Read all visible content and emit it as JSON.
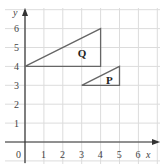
{
  "diagram": {
    "title": "",
    "axes": {
      "x_label": "x",
      "y_label": "y",
      "x_ticks": [
        "0",
        "1",
        "2",
        "3",
        "4",
        "5",
        "6"
      ],
      "y_ticks": [
        "1",
        "2",
        "3",
        "4",
        "5",
        "6"
      ],
      "origin_label": "0",
      "x_range": [
        0,
        6.5
      ],
      "y_range": [
        0,
        6.5
      ],
      "grid": true
    },
    "shapes": [
      {
        "name": "Q",
        "label": "Q",
        "type": "triangle",
        "vertices": [
          [
            0,
            4
          ],
          [
            4,
            6
          ],
          [
            4,
            4
          ]
        ],
        "label_pos": [
          3,
          4.7
        ]
      },
      {
        "name": "P",
        "label": "P",
        "type": "triangle",
        "vertices": [
          [
            3,
            3
          ],
          [
            5,
            4
          ],
          [
            5,
            3
          ]
        ],
        "label_pos": [
          4.5,
          3.3
        ]
      }
    ],
    "colors": {
      "grid": "#dcdcdc",
      "axis": "#333333",
      "shape_stroke": "#666666",
      "text": "#444444"
    }
  }
}
